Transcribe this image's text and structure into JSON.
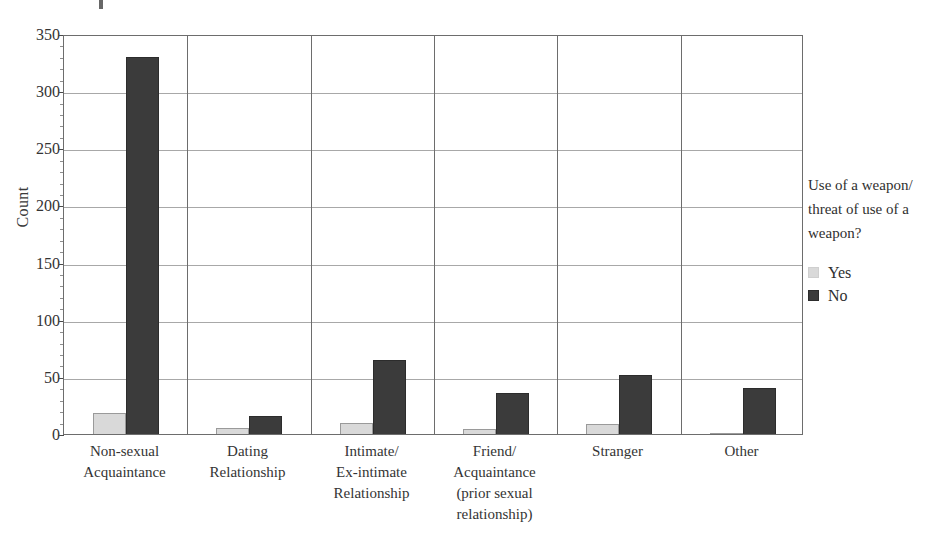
{
  "chart_data": {
    "type": "bar",
    "title": "",
    "xlabel": "",
    "ylabel": "Count",
    "ylim": [
      0,
      350
    ],
    "ytick_values": [
      0,
      50,
      100,
      150,
      200,
      250,
      300,
      350
    ],
    "ytick_labels": [
      "0",
      "50",
      "100",
      "150",
      "200",
      "250",
      "300",
      "350"
    ],
    "grid": "horizontal-major-only",
    "minor_ticks": true,
    "legend_position": "right",
    "legend_title": "Use of a weapon/ threat of use of a weapon?",
    "legend_title_lines": [
      "Use of a weapon/",
      "threat of use of a",
      "weapon?"
    ],
    "categories": [
      "Non-sexual Acquaintance",
      "Dating Relationship",
      "Intimate/ Ex-intimate Relationship",
      "Friend/ Acquaintance (prior sexual relationship)",
      "Stranger",
      "Other"
    ],
    "category_label_lines": [
      [
        "Non-sexual",
        "Acquaintance"
      ],
      [
        "Dating",
        "Relationship"
      ],
      [
        "Intimate/",
        "Ex-intimate",
        "Relationship"
      ],
      [
        "Friend/",
        "Acquaintance",
        "(prior sexual",
        "relationship)"
      ],
      [
        "Stranger"
      ],
      [
        "Other"
      ]
    ],
    "series": [
      {
        "name": "Yes",
        "color": "#d9d9d9",
        "values": [
          18,
          5,
          10,
          4,
          9,
          1
        ]
      },
      {
        "name": "No",
        "color": "#3b3b3b",
        "values": [
          330,
          16,
          65,
          36,
          52,
          40
        ]
      }
    ]
  },
  "axis": {
    "y_label": "Count"
  },
  "legend": {
    "title_line_1": "Use of a weapon/",
    "title_line_2": "threat of use of a",
    "title_line_3": "weapon?",
    "items": [
      {
        "label": "Yes"
      },
      {
        "label": "No"
      }
    ]
  },
  "colors": {
    "series_yes": "#d9d9d9",
    "series_no": "#3b3b3b",
    "frame": "#6d6d6d",
    "gridline": "#a8a8a8",
    "text": "#343434",
    "background": "#ffffff"
  }
}
